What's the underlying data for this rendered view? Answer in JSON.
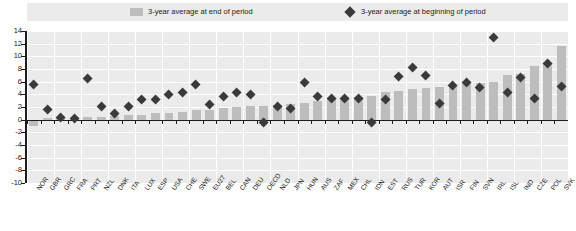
{
  "legend": {
    "end_of_period": {
      "label": "3-year average at end of period",
      "icon": "bar-swatch",
      "color": "#bdbdbd"
    },
    "beginning_of_period": {
      "label": "3-year average at beginning of period",
      "icon": "diamond-marker",
      "color": "#3a3a3a"
    }
  },
  "chart_data": {
    "type": "bar",
    "title": "",
    "subtitle": "",
    "xlabel": "",
    "ylabel": "",
    "ylim": [
      -10,
      14
    ],
    "yticks": [
      14,
      12,
      10,
      8,
      6,
      4,
      2,
      0,
      -2,
      -4,
      -6,
      -8,
      -10
    ],
    "ytick_labels": [
      "14",
      "12",
      "10",
      "8",
      "6",
      "4",
      "2",
      "0",
      "-2",
      "-4",
      "-6",
      "-8",
      "-10"
    ],
    "grid": true,
    "legend_position": "top",
    "categories": [
      "NOR",
      "GBR",
      "GRC",
      "FRA",
      "PRT",
      "NZL",
      "DNK",
      "ITA",
      "LUX",
      "ESP",
      "USA",
      "CHE",
      "SWE",
      "EU27",
      "BEL",
      "CAN",
      "DEU",
      "OECD",
      "NLD",
      "JPN",
      "HUN",
      "AUS",
      "ZAF",
      "MEX",
      "CHL",
      "IDN",
      "EST",
      "RUS",
      "TUR",
      "KOR",
      "AUT",
      "ISR",
      "FIN",
      "SVN",
      "IRL",
      "ISL",
      "IND",
      "CZE",
      "POL",
      "SVK"
    ],
    "series": [
      {
        "name": "3-year average at end of period",
        "type": "bar",
        "color": "#bdbdbd",
        "values": [
          -1.0,
          0.2,
          0.3,
          0.3,
          0.4,
          0.5,
          0.6,
          0.7,
          0.8,
          1.0,
          1.1,
          1.2,
          1.5,
          1.6,
          1.9,
          2.0,
          2.1,
          2.2,
          2.3,
          2.5,
          2.7,
          3.0,
          3.2,
          3.4,
          3.6,
          3.8,
          4.4,
          4.6,
          4.8,
          5.0,
          5.2,
          5.4,
          5.6,
          5.8,
          6.0,
          7.0,
          7.2,
          8.4,
          9.0,
          11.6
        ]
      },
      {
        "name": "3-year average at beginning of period",
        "type": "scatter",
        "color": "#3a3a3a",
        "values": [
          5.5,
          1.6,
          0.4,
          0.2,
          6.5,
          2.0,
          1.0,
          2.0,
          3.1,
          3.2,
          4.0,
          4.2,
          5.6,
          2.4,
          3.6,
          4.2,
          4.0,
          -0.4,
          2.0,
          1.8,
          5.8,
          3.6,
          3.4,
          3.3,
          3.3,
          -0.5,
          3.1,
          6.8,
          8.2,
          7.0,
          2.6,
          5.4,
          5.8,
          5.0,
          13.0,
          4.2,
          6.6,
          3.4,
          8.8,
          5.2
        ]
      }
    ]
  }
}
